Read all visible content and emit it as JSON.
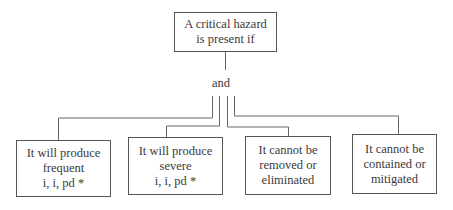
{
  "diagram": {
    "root": {
      "lines": [
        "A critical hazard",
        "is present if"
      ]
    },
    "connector_label": "and",
    "children": [
      {
        "lines": [
          "It will produce",
          "frequent",
          "i, i, pd *"
        ]
      },
      {
        "lines": [
          "It will produce",
          "severe",
          "i, i, pd *"
        ]
      },
      {
        "lines": [
          "It cannot be",
          "removed or",
          "eliminated"
        ]
      },
      {
        "lines": [
          "It cannot be",
          "contained or",
          "mitigated"
        ]
      }
    ],
    "colors": {
      "line": "#555555",
      "text": "#3a3a3a",
      "background": "#ffffff"
    }
  }
}
